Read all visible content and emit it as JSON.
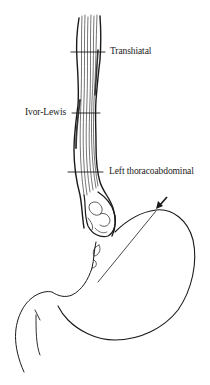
{
  "figure": {
    "labels": [
      {
        "id": "transhiatal",
        "text": "Transhiatal"
      },
      {
        "id": "ivor_lewis",
        "text": "Ivor-Lewis"
      },
      {
        "id": "left_thoracoabdominal",
        "text": "Left thoracoabdominal"
      }
    ],
    "annotations": {
      "arrow": "arrow-icon pointing to gastric resection line"
    },
    "colors": {
      "ink": "#1a1a1a",
      "background": "#ffffff"
    }
  }
}
